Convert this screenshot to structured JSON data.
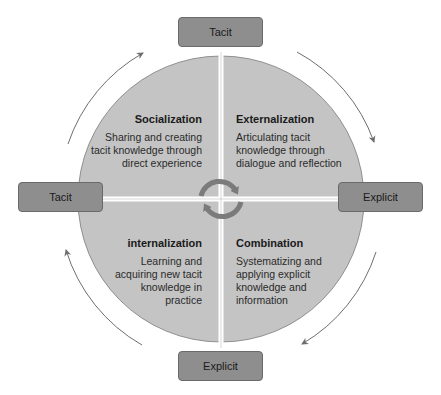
{
  "diagram": {
    "axis_labels": {
      "top": "Tacit",
      "left": "Tacit",
      "right": "Explicit",
      "bottom": "Explicit"
    },
    "quadrants": [
      {
        "id": "socialization",
        "position": "top-left",
        "title": "Socialization",
        "description_lines": [
          "Sharing and creating",
          "tacit knowledge through",
          "direct experience"
        ]
      },
      {
        "id": "externalization",
        "position": "top-right",
        "title": "Externalization",
        "description_lines": [
          "Articulating tacit",
          "knowledge through",
          "dialogue and reflection"
        ]
      },
      {
        "id": "internalization",
        "position": "bottom-left",
        "title": "internalization",
        "description_lines": [
          "Learning and",
          "acquiring new tacit",
          "knowledge in",
          "practice"
        ]
      },
      {
        "id": "combination",
        "position": "bottom-right",
        "title": "Combination",
        "description_lines": [
          "Systematizing and",
          "applying explicit",
          "knowledge and",
          "information"
        ]
      }
    ],
    "center_icon": "cycle-arrows-icon",
    "outer_arrows": "clockwise-cycle-arrows",
    "colors": {
      "circle_fill": "#c4c4c4",
      "circle_stroke": "#7a7a7a",
      "box_fill": "#8e8e8e",
      "arrow": "#6e6e6e",
      "divider": "#ffffff",
      "cycle_icon": "#7b7b7b"
    }
  }
}
